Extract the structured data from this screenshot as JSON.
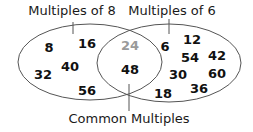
{
  "diagram": {
    "type": "venn",
    "labels": {
      "left": "Multiples of 8",
      "right": "Multiples of 6",
      "intersection": "Common Multiples"
    },
    "left_only": [
      {
        "value": "8",
        "x": 49,
        "y": 52
      },
      {
        "value": "16",
        "x": 87,
        "y": 48
      },
      {
        "value": "40",
        "x": 70,
        "y": 71
      },
      {
        "value": "32",
        "x": 43,
        "y": 79
      },
      {
        "value": "56",
        "x": 87,
        "y": 95
      }
    ],
    "intersection": [
      {
        "value": "24",
        "x": 130,
        "y": 50,
        "faded": true
      },
      {
        "value": "48",
        "x": 130,
        "y": 74,
        "faded": false
      }
    ],
    "right_only": [
      {
        "value": "6",
        "x": 165,
        "y": 51
      },
      {
        "value": "12",
        "x": 192,
        "y": 44
      },
      {
        "value": "54",
        "x": 190,
        "y": 62
      },
      {
        "value": "42",
        "x": 217,
        "y": 60
      },
      {
        "value": "30",
        "x": 178,
        "y": 79
      },
      {
        "value": "60",
        "x": 217,
        "y": 78
      },
      {
        "value": "18",
        "x": 163,
        "y": 98
      },
      {
        "value": "36",
        "x": 199,
        "y": 93
      }
    ],
    "colors": {
      "outline": "#555555",
      "text": "#111111",
      "faded_number": "#9a9a9a"
    }
  }
}
